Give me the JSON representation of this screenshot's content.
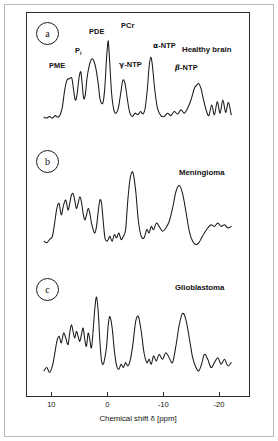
{
  "figure": {
    "panels": [
      {
        "tag": "a",
        "condition": "Healthy brain"
      },
      {
        "tag": "b",
        "condition": "Meningioma"
      },
      {
        "tag": "c",
        "condition": "Glioblastoma"
      }
    ],
    "peak_labels": [
      {
        "text": "PME",
        "x_ppm": 6.5
      },
      {
        "text": "Pi",
        "x_ppm": 4.9
      },
      {
        "text": "PDE",
        "x_ppm": 2.8
      },
      {
        "text": "PCr",
        "x_ppm": 0.0
      },
      {
        "text": "γ-NTP",
        "x_ppm": -2.5
      },
      {
        "text": "α-NTP",
        "x_ppm": -7.6
      },
      {
        "text": "β-NTP",
        "x_ppm": -16.2
      }
    ]
  },
  "axis": {
    "label": "Chemical shift δ [ppm]",
    "ticks": [
      "10",
      "0",
      "-10",
      "-20"
    ],
    "tick_values": [
      10,
      0,
      -10,
      -20
    ],
    "xlim": [
      11.5,
      -22.5
    ]
  },
  "chart_data": {
    "type": "line",
    "title": "",
    "subtitle": "",
    "xlabel": "Chemical shift δ [ppm]",
    "ylabel": "",
    "xlim": [
      11.5,
      -22.5
    ],
    "grid": false,
    "legend": "none",
    "annotations": [
      "PME",
      "Pi",
      "PDE",
      "PCr",
      "γ-NTP",
      "α-NTP",
      "β-NTP",
      "Healthy brain",
      "Meningioma",
      "Glioblastoma"
    ],
    "series": [
      {
        "name": "Healthy brain",
        "panel": "a",
        "peaks": [
          {
            "label": "PME",
            "ppm": 6.5,
            "rel_height": 0.55
          },
          {
            "label": "Pi",
            "ppm": 4.9,
            "rel_height": 0.62
          },
          {
            "label": "PDE",
            "ppm": 2.6,
            "rel_height": 0.78
          },
          {
            "label": "PCr",
            "ppm": 0.0,
            "rel_height": 1.0
          },
          {
            "label": "γ-NTP",
            "ppm": -2.6,
            "rel_height": 0.52
          },
          {
            "label": "α-NTP",
            "ppm": -7.6,
            "rel_height": 0.8
          },
          {
            "label": "β-NTP",
            "ppm": -16.2,
            "rel_height": 0.48
          }
        ],
        "x": [
          11.5,
          11.0,
          10.5,
          10.0,
          9.5,
          9.0,
          8.6,
          8.2,
          7.8,
          7.4,
          7.0,
          6.8,
          6.5,
          6.2,
          5.9,
          5.6,
          5.3,
          5.1,
          4.9,
          4.7,
          4.4,
          4.1,
          3.8,
          3.4,
          3.0,
          2.6,
          2.2,
          1.8,
          1.5,
          1.2,
          0.9,
          0.6,
          0.3,
          0.1,
          0.0,
          -0.1,
          -0.3,
          -0.6,
          -1.0,
          -1.4,
          -1.8,
          -2.2,
          -2.6,
          -3.0,
          -3.4,
          -3.8,
          -4.3,
          -4.8,
          -5.3,
          -5.8,
          -6.2,
          -6.6,
          -7.0,
          -7.3,
          -7.6,
          -7.9,
          -8.3,
          -8.8,
          -9.4,
          -10.0,
          -10.6,
          -11.2,
          -11.8,
          -12.4,
          -13.0,
          -13.6,
          -14.2,
          -14.8,
          -15.4,
          -15.8,
          -16.2,
          -16.6,
          -17.0,
          -17.5,
          -18.0,
          -18.5,
          -19.0,
          -19.5,
          -20.0,
          -20.5,
          -21.0,
          -21.5,
          -22.0
        ],
        "y": [
          0.07,
          0.06,
          0.08,
          0.06,
          0.09,
          0.07,
          0.1,
          0.2,
          0.4,
          0.52,
          0.54,
          0.55,
          0.54,
          0.4,
          0.28,
          0.34,
          0.52,
          0.6,
          0.62,
          0.5,
          0.3,
          0.35,
          0.55,
          0.7,
          0.78,
          0.76,
          0.66,
          0.48,
          0.3,
          0.24,
          0.26,
          0.45,
          0.8,
          0.96,
          1.0,
          0.92,
          0.7,
          0.36,
          0.16,
          0.12,
          0.18,
          0.35,
          0.52,
          0.48,
          0.3,
          0.14,
          0.08,
          0.12,
          0.1,
          0.14,
          0.11,
          0.18,
          0.42,
          0.68,
          0.8,
          0.7,
          0.42,
          0.18,
          0.09,
          0.08,
          0.12,
          0.09,
          0.14,
          0.11,
          0.16,
          0.12,
          0.18,
          0.28,
          0.42,
          0.46,
          0.48,
          0.42,
          0.3,
          0.16,
          0.09,
          0.22,
          0.1,
          0.26,
          0.12,
          0.28,
          0.13,
          0.25,
          0.1
        ]
      },
      {
        "name": "Meningioma",
        "panel": "b",
        "x": [
          11.5,
          11.0,
          10.5,
          10.0,
          9.6,
          9.2,
          8.8,
          8.4,
          8.0,
          7.6,
          7.2,
          6.9,
          6.6,
          6.3,
          6.0,
          5.7,
          5.4,
          5.1,
          4.8,
          4.5,
          4.2,
          3.9,
          3.6,
          3.3,
          3.0,
          2.7,
          2.4,
          2.1,
          1.8,
          1.5,
          1.2,
          0.9,
          0.6,
          0.3,
          0.0,
          -0.3,
          -0.7,
          -1.1,
          -1.5,
          -1.9,
          -2.3,
          -2.7,
          -3.1,
          -3.5,
          -3.9,
          -4.4,
          -4.9,
          -5.4,
          -5.9,
          -6.4,
          -6.9,
          -7.3,
          -7.7,
          -8.1,
          -8.6,
          -9.1,
          -9.7,
          -10.3,
          -10.9,
          -11.5,
          -12.1,
          -12.7,
          -13.3,
          -13.9,
          -14.5,
          -15.1,
          -15.7,
          -16.2,
          -16.7,
          -17.2,
          -17.8,
          -18.4,
          -19.0,
          -19.6,
          -20.2,
          -20.8,
          -21.4,
          -22.0
        ],
        "y": [
          0.12,
          0.1,
          0.14,
          0.18,
          0.34,
          0.52,
          0.58,
          0.44,
          0.56,
          0.62,
          0.5,
          0.58,
          0.68,
          0.7,
          0.62,
          0.52,
          0.58,
          0.66,
          0.6,
          0.46,
          0.38,
          0.44,
          0.52,
          0.46,
          0.34,
          0.26,
          0.22,
          0.3,
          0.48,
          0.62,
          0.58,
          0.36,
          0.16,
          0.12,
          0.14,
          0.18,
          0.12,
          0.2,
          0.16,
          0.22,
          0.14,
          0.18,
          0.26,
          0.62,
          0.88,
          0.96,
          0.74,
          0.36,
          0.18,
          0.16,
          0.26,
          0.22,
          0.3,
          0.26,
          0.34,
          0.3,
          0.24,
          0.28,
          0.36,
          0.52,
          0.72,
          0.8,
          0.7,
          0.48,
          0.24,
          0.12,
          0.08,
          0.1,
          0.16,
          0.22,
          0.28,
          0.32,
          0.3,
          0.34,
          0.3,
          0.32,
          0.28,
          0.3
        ]
      },
      {
        "name": "Glioblastoma",
        "panel": "c",
        "x": [
          11.5,
          11.0,
          10.5,
          10.0,
          9.6,
          9.2,
          8.8,
          8.4,
          8.0,
          7.6,
          7.2,
          6.9,
          6.6,
          6.3,
          6.0,
          5.7,
          5.4,
          5.1,
          4.8,
          4.5,
          4.2,
          3.9,
          3.6,
          3.3,
          3.0,
          2.7,
          2.4,
          2.1,
          1.8,
          1.5,
          1.2,
          0.9,
          0.6,
          0.3,
          0.0,
          -0.3,
          -0.7,
          -1.1,
          -1.5,
          -1.9,
          -2.3,
          -2.7,
          -3.1,
          -3.5,
          -3.9,
          -4.4,
          -4.9,
          -5.4,
          -5.9,
          -6.4,
          -6.9,
          -7.3,
          -7.7,
          -8.1,
          -8.6,
          -9.1,
          -9.7,
          -10.3,
          -10.9,
          -11.5,
          -12.1,
          -12.7,
          -13.3,
          -13.9,
          -14.5,
          -15.1,
          -15.7,
          -16.2,
          -16.7,
          -17.2,
          -17.8,
          -18.4,
          -19.0,
          -19.6,
          -20.2,
          -20.8,
          -21.4,
          -22.0
        ],
        "y": [
          0.1,
          0.14,
          0.08,
          0.16,
          0.3,
          0.46,
          0.52,
          0.44,
          0.56,
          0.5,
          0.42,
          0.56,
          0.66,
          0.58,
          0.5,
          0.58,
          0.52,
          0.46,
          0.54,
          0.62,
          0.48,
          0.4,
          0.56,
          0.48,
          0.38,
          0.6,
          0.86,
          1.0,
          0.82,
          0.46,
          0.22,
          0.18,
          0.26,
          0.4,
          0.66,
          0.76,
          0.62,
          0.34,
          0.16,
          0.12,
          0.18,
          0.14,
          0.2,
          0.16,
          0.22,
          0.42,
          0.7,
          0.76,
          0.58,
          0.32,
          0.2,
          0.24,
          0.18,
          0.28,
          0.22,
          0.3,
          0.24,
          0.32,
          0.26,
          0.2,
          0.4,
          0.66,
          0.8,
          0.72,
          0.5,
          0.26,
          0.14,
          0.1,
          0.18,
          0.3,
          0.24,
          0.14,
          0.2,
          0.26,
          0.18,
          0.24,
          0.16,
          0.2
        ]
      }
    ]
  }
}
